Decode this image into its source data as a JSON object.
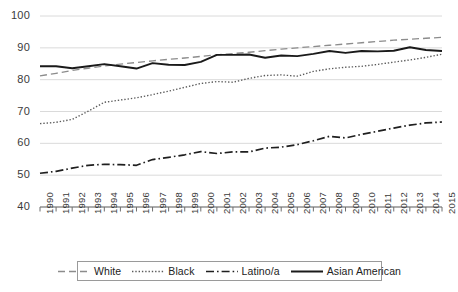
{
  "chart_data": {
    "type": "line",
    "title": "",
    "xlabel": "",
    "ylabel": "",
    "grid": true,
    "legend_position": "bottom",
    "ylim": [
      40,
      100
    ],
    "yticks": [
      40,
      50,
      60,
      70,
      80,
      90,
      100
    ],
    "ytick_labels": [
      "40",
      "50",
      "60",
      "70",
      "80",
      "90",
      "100"
    ],
    "x": [
      1990,
      1991,
      1992,
      1993,
      1994,
      1995,
      1996,
      1997,
      1998,
      1999,
      2000,
      2001,
      2002,
      2003,
      2004,
      2005,
      2006,
      2007,
      2008,
      2009,
      2010,
      2011,
      2012,
      2013,
      2014,
      2015
    ],
    "xtick_labels": [
      "1990",
      "1991",
      "1992",
      "1993",
      "1994",
      "1995",
      "1996",
      "1997",
      "1998",
      "1999",
      "2000",
      "2001",
      "2002",
      "2003",
      "2004",
      "2005",
      "2006",
      "2007",
      "2008",
      "2009",
      "2010",
      "2011",
      "2012",
      "2013",
      "2014",
      "2015"
    ],
    "series": [
      {
        "name": "White",
        "style": "dashed",
        "color": "#8c8c8c",
        "values": [
          81.2,
          82.0,
          82.9,
          83.6,
          84.3,
          84.9,
          85.4,
          85.9,
          86.4,
          86.8,
          87.3,
          87.8,
          88.2,
          88.6,
          89.1,
          89.6,
          90.0,
          90.4,
          90.8,
          91.2,
          91.6,
          92.0,
          92.4,
          92.7,
          93.0,
          93.3
        ]
      },
      {
        "name": "Black",
        "style": "dotted",
        "color": "#5a5a5a",
        "values": [
          66.2,
          66.6,
          67.5,
          70.1,
          72.9,
          73.6,
          74.3,
          75.3,
          76.4,
          77.6,
          78.8,
          79.4,
          79.2,
          80.4,
          81.3,
          81.5,
          81.1,
          82.6,
          83.4,
          83.9,
          84.2,
          84.8,
          85.5,
          86.2,
          87.0,
          88.0
        ]
      },
      {
        "name": "Latino/a",
        "style": "dashdot",
        "color": "#1f1f1f",
        "values": [
          50.6,
          51.2,
          52.2,
          53.1,
          53.4,
          53.3,
          53.1,
          54.9,
          55.6,
          56.4,
          57.4,
          56.8,
          57.3,
          57.3,
          58.5,
          58.8,
          59.6,
          60.8,
          62.2,
          61.7,
          62.8,
          63.8,
          64.8,
          65.7,
          66.4,
          66.7
        ]
      },
      {
        "name": "Asian American",
        "style": "solid",
        "color": "#1a1a1a",
        "values": [
          84.2,
          84.2,
          83.6,
          84.2,
          84.9,
          84.2,
          83.5,
          85.2,
          84.7,
          84.6,
          85.6,
          87.8,
          87.8,
          87.9,
          86.9,
          87.6,
          87.4,
          88.1,
          89.0,
          88.4,
          89.0,
          88.9,
          89.1,
          90.2,
          89.3,
          89.0
        ]
      }
    ]
  },
  "legend": {
    "items": [
      {
        "label": "White"
      },
      {
        "label": "Black"
      },
      {
        "label": "Latino/a"
      },
      {
        "label": "Asian American"
      }
    ]
  }
}
